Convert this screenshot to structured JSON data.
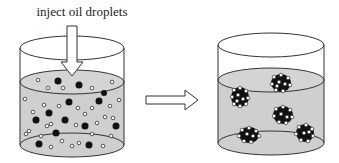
{
  "caption": {
    "label": "inject oil droplets"
  },
  "colors": {
    "liquid": "#cfcfcf",
    "outline": "#333333",
    "dark_particle": "#111111",
    "light_particle": "#ffffff"
  },
  "left_beaker": {
    "contents": "dispersed dark and light particles",
    "dark_particle_count": 14,
    "light_particle_count": 30
  },
  "process_arrow": {
    "direction": "right"
  },
  "right_beaker": {
    "contents": "aggregated clusters",
    "cluster_count": 5
  }
}
